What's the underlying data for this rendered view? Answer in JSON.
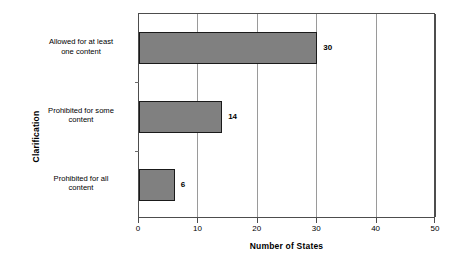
{
  "chart_data": {
    "type": "bar",
    "orientation": "horizontal",
    "title": "",
    "xlabel": "Number of States",
    "ylabel": "Clarification",
    "categories": [
      "Allowed for at least one content",
      "Prohibited for some content",
      "Prohibited for all content"
    ],
    "category_lines": [
      [
        "Allowed for at least",
        "one content"
      ],
      [
        "Prohibited for some",
        "content"
      ],
      [
        "Prohibited for all",
        "content"
      ]
    ],
    "values": [
      30,
      14,
      6
    ],
    "value_labels": [
      "30",
      "14",
      "6"
    ],
    "xlim": [
      0,
      50
    ],
    "xticks": [
      0,
      10,
      20,
      30,
      40,
      50
    ],
    "xtick_labels": [
      "0",
      "10",
      "20",
      "30",
      "40",
      "50"
    ],
    "grid": "vertical-major",
    "legend": "none",
    "colors": {
      "bar_fill": "#808080",
      "bar_border": "#1a1a1a",
      "gridline": "#9a9a9a",
      "axis": "#4d4d4d",
      "background": "#ffffff",
      "text": "#000000"
    }
  }
}
